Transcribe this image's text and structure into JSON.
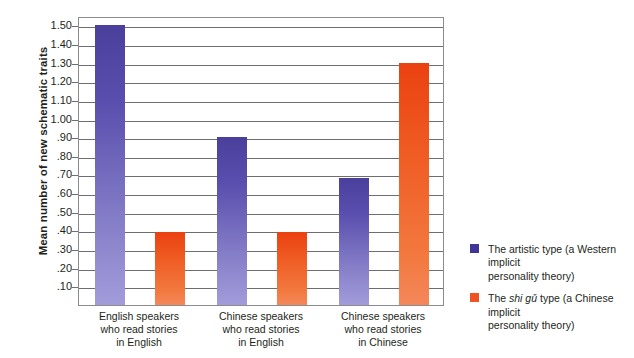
{
  "chart_data": {
    "type": "bar",
    "title": "",
    "xlabel": "",
    "ylabel": "Mean number of new schematic traits",
    "ylim": [
      0,
      1.55
    ],
    "grid": true,
    "legend_position": "right",
    "categories": [
      "English speakers who read stories in English",
      "Chinese speakers who read stories in English",
      "Chinese speakers who read stories in Chinese"
    ],
    "category_lines": [
      [
        "English speakers",
        "who read stories",
        "in English"
      ],
      [
        "Chinese speakers",
        "who read stories",
        "in English"
      ],
      [
        "Chinese speakers",
        "who read stories",
        "in Chinese"
      ]
    ],
    "ytick_labels": [
      ".10",
      ".20",
      ".30",
      ".40",
      ".50",
      ".60",
      ".70",
      ".80",
      ".90",
      "1.00",
      "1.10",
      "1.20",
      "1.30",
      "1.40",
      "1.50"
    ],
    "ytick_values": [
      0.1,
      0.2,
      0.3,
      0.4,
      0.5,
      0.6,
      0.7,
      0.8,
      0.9,
      1.0,
      1.1,
      1.2,
      1.3,
      1.4,
      1.5
    ],
    "series": [
      {
        "name": "The artistic type (a Western implicit personality theory)",
        "short_name": "artistic",
        "color": "#4b3f9c",
        "values": [
          1.5,
          0.9,
          0.68
        ]
      },
      {
        "name": "The shi gu type (a Chinese implicit personality theory)",
        "short_name": "shigu",
        "color": "#ea4110",
        "values": [
          0.39,
          0.39,
          1.3
        ]
      }
    ]
  },
  "legend": {
    "items": [
      {
        "swatch": "artistic",
        "pre": "The artistic type (a Western implicit",
        "italic": "",
        "post": "",
        "line2": "personality theory)"
      },
      {
        "swatch": "shigu",
        "pre": "The ",
        "italic": "shi gǔ",
        "post": " type (a Chinese implicit",
        "line2": "personality theory)"
      }
    ]
  },
  "colors": {
    "artistic_top": "#4b3f9c",
    "artistic_bottom": "#a29cdb",
    "shigu_top": "#ea4110",
    "shigu_bottom": "#f4875a",
    "axis": "#8c8c8c",
    "gridline": "#6d6e71",
    "text": "#231f20",
    "background": "#ffffff"
  }
}
